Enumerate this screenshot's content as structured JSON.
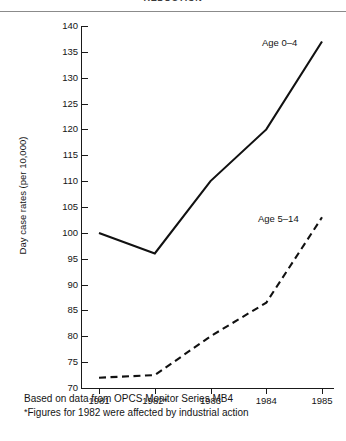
{
  "header": {
    "clipped_title": "REDUCTION"
  },
  "chart_data": {
    "type": "line",
    "title": "",
    "xlabel": "",
    "ylabel": "Day case rates (per 10,000)",
    "categories": [
      "1981",
      "1982*",
      "1983",
      "1984",
      "1985"
    ],
    "x_tick_labels": [
      "1981",
      "1982*",
      "1983",
      "1984",
      "1985"
    ],
    "y_tick_labels": [
      "140",
      "135",
      "130",
      "125",
      "120",
      "115",
      "110",
      "105",
      "100",
      "95",
      "90",
      "85",
      "80",
      "75",
      "70"
    ],
    "ylim": [
      70,
      140
    ],
    "ytick_step": 5,
    "grid": false,
    "legend_position": "inline-right",
    "series": [
      {
        "name": "Age 0–4",
        "style": "solid",
        "color": "#111111",
        "values": [
          100,
          96,
          110,
          120,
          137
        ]
      },
      {
        "name": "Age 5–14",
        "style": "dashed",
        "color": "#111111",
        "values": [
          72,
          72.5,
          80,
          86.5,
          103
        ]
      }
    ]
  },
  "footnotes": {
    "source": "Based on data from OPCS Monitor Series MB4",
    "star": "*",
    "note": "Figures for 1982 were affected by industrial action"
  }
}
